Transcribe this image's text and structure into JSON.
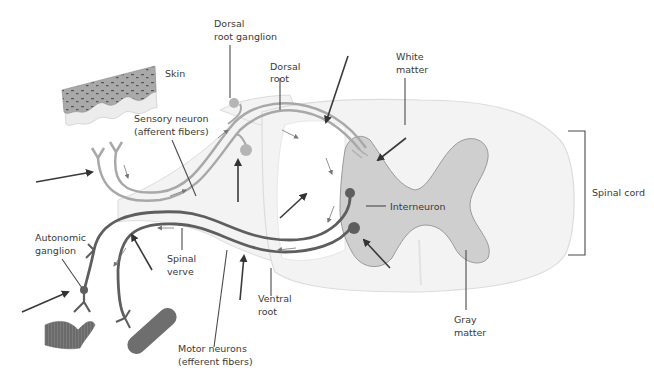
{
  "colors": {
    "background": "#ffffff",
    "white_matter": "#f3f3f3",
    "white_matter_outline": "#dcdcdc",
    "gray_matter": "#cfcfcf",
    "gray_matter_outline": "#9a9a9a",
    "sensory_fiber": "#a8a8a8",
    "motor_fiber": "#5e5e5e",
    "arrow": "#333333",
    "text": "#3a3a3a"
  },
  "labels": {
    "dorsal_root_ganglion": [
      "Dorsal",
      "root ganglion"
    ],
    "dorsal_root": [
      "Dorsal",
      "root"
    ],
    "white_matter": [
      "White",
      "matter"
    ],
    "skin": "Skin",
    "sensory_neuron": [
      "Sensory neuron",
      "(afferent fibers)"
    ],
    "spinal_cord": "Spinal cord",
    "interneuron": "Interneuron",
    "autonomic_ganglion": [
      "Autonomic",
      "ganglion"
    ],
    "spinal_nerve": [
      "Spinal",
      "verve"
    ],
    "ventral_root": [
      "Ventral",
      "root"
    ],
    "gray_matter": [
      "Gray",
      "matter"
    ],
    "motor_neurons": [
      "Motor neurons",
      "(efferent fibers)"
    ]
  }
}
